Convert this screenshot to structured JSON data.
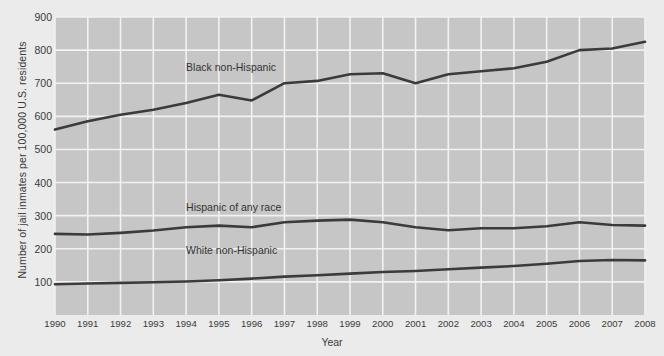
{
  "chart_data": {
    "type": "line",
    "title": "",
    "xlabel": "Year",
    "ylabel": "Number of jail inmates per 100,000 U.S. residents",
    "x": [
      1990,
      1991,
      1992,
      1993,
      1994,
      1995,
      1996,
      1997,
      1998,
      1999,
      2000,
      2001,
      2002,
      2003,
      2004,
      2005,
      2006,
      2007,
      2008
    ],
    "xlim": [
      1990,
      2008
    ],
    "ylim": [
      0,
      900
    ],
    "yticks": [
      100,
      200,
      300,
      400,
      500,
      600,
      700,
      800,
      900
    ],
    "grid": true,
    "legend_position": "inline-labels",
    "series": [
      {
        "name": "Black non-Hispanic",
        "color": "#3b3b3b",
        "label_x": 1994.0,
        "label_y": 745,
        "values": [
          560,
          585,
          605,
          620,
          640,
          665,
          648,
          700,
          707,
          727,
          730,
          700,
          727,
          736,
          745,
          765,
          800,
          805,
          825
        ]
      },
      {
        "name": "Hispanic of any race",
        "color": "#3b3b3b",
        "label_x": 1994.0,
        "label_y": 322,
        "values": [
          245,
          243,
          248,
          255,
          265,
          270,
          265,
          280,
          285,
          288,
          280,
          265,
          256,
          262,
          262,
          268,
          280,
          272,
          270
        ]
      },
      {
        "name": "White non-Hispanic",
        "color": "#3b3b3b",
        "label_x": 1994.0,
        "label_y": 192,
        "values": [
          93,
          95,
          97,
          99,
          101,
          105,
          110,
          116,
          120,
          125,
          130,
          133,
          138,
          143,
          148,
          155,
          163,
          166,
          165
        ]
      }
    ]
  },
  "colors": {
    "page_background": "#ebebeb",
    "plot_background": "#c6c6c6",
    "grid": "#f2f2f2",
    "line": "#3b3b3b",
    "text": "#3a3a3a"
  }
}
